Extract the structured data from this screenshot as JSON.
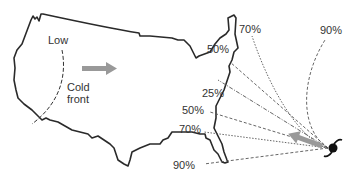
{
  "diagram": {
    "title": "",
    "labels": {
      "low": "Low",
      "cold_front": [
        "Cold",
        "front"
      ]
    },
    "probability_labels": [
      {
        "id": "p70_top",
        "text": "70%"
      },
      {
        "id": "p90_top",
        "text": "90%"
      },
      {
        "id": "p50_upper",
        "text": "50%"
      },
      {
        "id": "p25",
        "text": "25%"
      },
      {
        "id": "p50_lower",
        "text": "50%"
      },
      {
        "id": "p70_lower",
        "text": "70%"
      },
      {
        "id": "p90_lower",
        "text": "90%"
      }
    ],
    "symbols": {
      "hurricane": "hurricane-icon",
      "storm_motion_arrow": "arrow-left-up",
      "front_motion_arrow": "arrow-right"
    },
    "colors": {
      "outline": "#2a2a2a",
      "arrow": "#999999",
      "dashed": "#555555",
      "text": "#333333"
    }
  }
}
